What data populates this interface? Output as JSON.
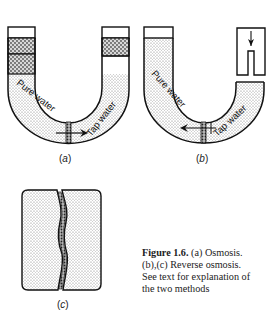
{
  "figure": {
    "panels": [
      {
        "id": "a",
        "label": "a",
        "left_text": "Pure water",
        "right_text": "Tap water",
        "arrow_direction": "right"
      },
      {
        "id": "b",
        "label": "b",
        "left_text": "Pure water",
        "right_text": "Tap water",
        "arrow_direction": "left"
      },
      {
        "id": "c",
        "label": "c"
      }
    ],
    "caption": {
      "number": "Figure 1.6.",
      "line1_rest": " (a) Osmosis.",
      "line2": "(b),(c) Reverse osmosis.",
      "line3": "See text for explanation of",
      "line4": "the two methods"
    }
  },
  "colors": {
    "stroke": "#111111",
    "fill_dots": "#9a9a9a",
    "background": "#ffffff"
  }
}
